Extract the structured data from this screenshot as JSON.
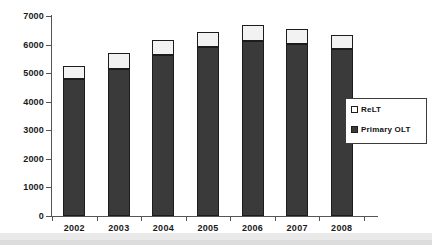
{
  "chart_data": {
    "type": "bar",
    "subtype": "stacked-bar",
    "title": "",
    "xlabel": "",
    "ylabel": "",
    "categories": [
      "2002",
      "2003",
      "2004",
      "2005",
      "2006",
      "2007",
      "2008"
    ],
    "series": [
      {
        "name": "Primary OLT",
        "color": "#3a3a3a",
        "values": [
          4800,
          5150,
          5650,
          5900,
          6120,
          6020,
          5850
        ]
      },
      {
        "name": "ReLT",
        "color": "#f2f2f2",
        "values": [
          450,
          550,
          510,
          550,
          580,
          510,
          490
        ]
      }
    ],
    "totals": [
      5250,
      5700,
      6160,
      6450,
      6700,
      6530,
      6340
    ],
    "ylim": [
      0,
      7000
    ],
    "ytick_labels": [
      "0",
      "1000",
      "2000",
      "3000",
      "4000",
      "5000",
      "6000",
      "7000"
    ],
    "ytick_values": [
      0,
      1000,
      2000,
      3000,
      4000,
      5000,
      6000,
      7000
    ],
    "grid": false,
    "legend_position": "right",
    "legend_entries": [
      {
        "label": "ReLT",
        "swatch": "light"
      },
      {
        "label": "Primary OLT",
        "swatch": "dark"
      }
    ]
  }
}
